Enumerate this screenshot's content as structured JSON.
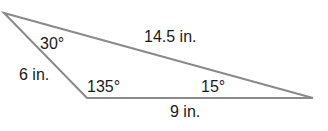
{
  "diagram": {
    "type": "triangle",
    "stroke_color": "#8a8a8a",
    "text_color": "#1a1a1a",
    "vertices": {
      "top_left": [
        4,
        13
      ],
      "bottom_left": [
        87,
        98
      ],
      "right": [
        313,
        98
      ]
    },
    "angles": {
      "top_left": "30°",
      "bottom_left": "135°",
      "right": "15°"
    },
    "sides": {
      "left": "6 in.",
      "top": "14.5 in.",
      "bottom": "9 in."
    }
  }
}
